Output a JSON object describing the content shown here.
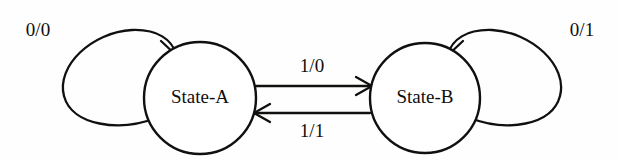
{
  "figure": {
    "kind": "finite-state-machine-diagram",
    "background_color": "#fefefe",
    "ink_color": "#12100f"
  },
  "states": [
    {
      "id": "state-a",
      "label": "State-A",
      "center_x": 200,
      "center_y": 98,
      "radius": 56
    },
    {
      "id": "state-b",
      "label": "State-B",
      "center_x": 425,
      "center_y": 98,
      "radius": 55
    }
  ],
  "transitions": [
    {
      "id": "a-to-a",
      "label": "0/0",
      "from": "state-a",
      "to": "state-a",
      "kind": "self-loop",
      "side": "left",
      "label_x": 38,
      "label_y": 32
    },
    {
      "id": "a-to-b",
      "label": "1/0",
      "from": "state-a",
      "to": "state-b",
      "kind": "straight",
      "label_x": 312,
      "label_y": 68
    },
    {
      "id": "b-to-a",
      "label": "1/1",
      "from": "state-b",
      "to": "state-a",
      "kind": "straight",
      "label_x": 312,
      "label_y": 133
    },
    {
      "id": "b-to-b",
      "label": "0/1",
      "from": "state-b",
      "to": "state-b",
      "kind": "self-loop",
      "side": "right",
      "label_x": 582,
      "label_y": 32
    }
  ]
}
